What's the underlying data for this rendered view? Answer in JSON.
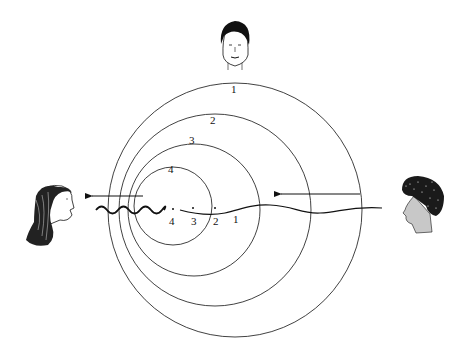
{
  "diagram": {
    "wavefront_labels": [
      "1",
      "2",
      "3",
      "4"
    ],
    "source_position_labels": [
      "4",
      "3",
      "2",
      "1"
    ],
    "observers": [
      {
        "id": "top",
        "icon": "face-front-icon"
      },
      {
        "id": "left",
        "icon": "face-long-hair-icon"
      },
      {
        "id": "right",
        "icon": "face-curly-hair-icon"
      }
    ],
    "arrows": [
      {
        "id": "left-arrow",
        "direction": "left"
      },
      {
        "id": "right-arrow",
        "direction": "left"
      }
    ],
    "colors": {
      "line": "#111111",
      "background": "#ffffff",
      "skin_shade": "#c8c8c8"
    }
  }
}
